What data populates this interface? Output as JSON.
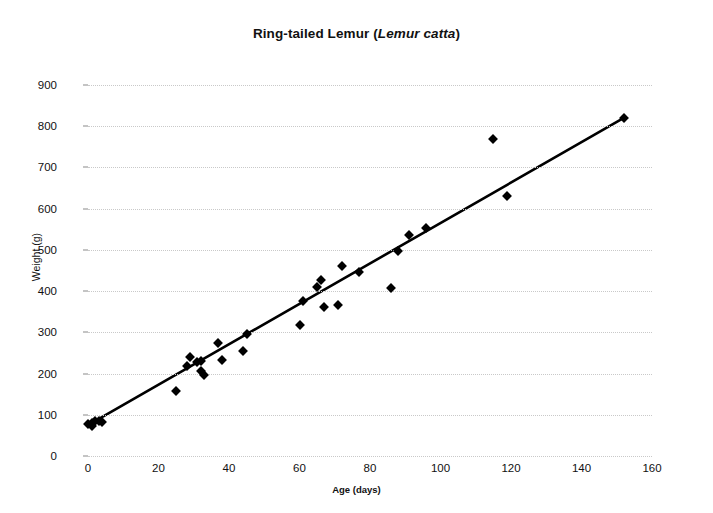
{
  "chart_data": {
    "type": "scatter",
    "title": "Ring-tailed Lemur (Lemur catta)",
    "title_plain": "Ring-tailed Lemur (",
    "title_species": "Lemur catta",
    "title_close": ")",
    "xlabel": "Age (days)",
    "ylabel": "Weight (g)",
    "xlim": [
      0,
      160
    ],
    "ylim": [
      0,
      900
    ],
    "xticks": [
      0,
      20,
      40,
      60,
      80,
      100,
      120,
      140,
      160
    ],
    "yticks": [
      0,
      100,
      200,
      300,
      400,
      500,
      600,
      700,
      800,
      900
    ],
    "grid": "horizontal-dotted",
    "legend": "none",
    "marker": "black-diamond",
    "point_color": "#000000",
    "gridline_color": "#c9c9c9",
    "axis_color": "#7a7a7a",
    "points": [
      {
        "x": 0,
        "y": 78
      },
      {
        "x": 1,
        "y": 80
      },
      {
        "x": 1,
        "y": 72
      },
      {
        "x": 2,
        "y": 84
      },
      {
        "x": 3,
        "y": 85
      },
      {
        "x": 4,
        "y": 82
      },
      {
        "x": 25,
        "y": 158
      },
      {
        "x": 28,
        "y": 218
      },
      {
        "x": 29,
        "y": 241
      },
      {
        "x": 31,
        "y": 228
      },
      {
        "x": 32,
        "y": 231
      },
      {
        "x": 32,
        "y": 207
      },
      {
        "x": 33,
        "y": 196
      },
      {
        "x": 37,
        "y": 273
      },
      {
        "x": 38,
        "y": 234
      },
      {
        "x": 44,
        "y": 254
      },
      {
        "x": 45,
        "y": 295
      },
      {
        "x": 60,
        "y": 318
      },
      {
        "x": 61,
        "y": 375
      },
      {
        "x": 65,
        "y": 409
      },
      {
        "x": 66,
        "y": 427
      },
      {
        "x": 67,
        "y": 362
      },
      {
        "x": 71,
        "y": 366
      },
      {
        "x": 72,
        "y": 461
      },
      {
        "x": 77,
        "y": 446
      },
      {
        "x": 86,
        "y": 408
      },
      {
        "x": 88,
        "y": 497
      },
      {
        "x": 91,
        "y": 537
      },
      {
        "x": 96,
        "y": 553
      },
      {
        "x": 115,
        "y": 770
      },
      {
        "x": 119,
        "y": 630
      },
      {
        "x": 152,
        "y": 820
      }
    ],
    "trendline": {
      "x_start": 0,
      "y_start": 75,
      "x_end": 152,
      "y_end": 820,
      "slope": 4.9,
      "intercept": 75,
      "color": "#000000"
    }
  }
}
